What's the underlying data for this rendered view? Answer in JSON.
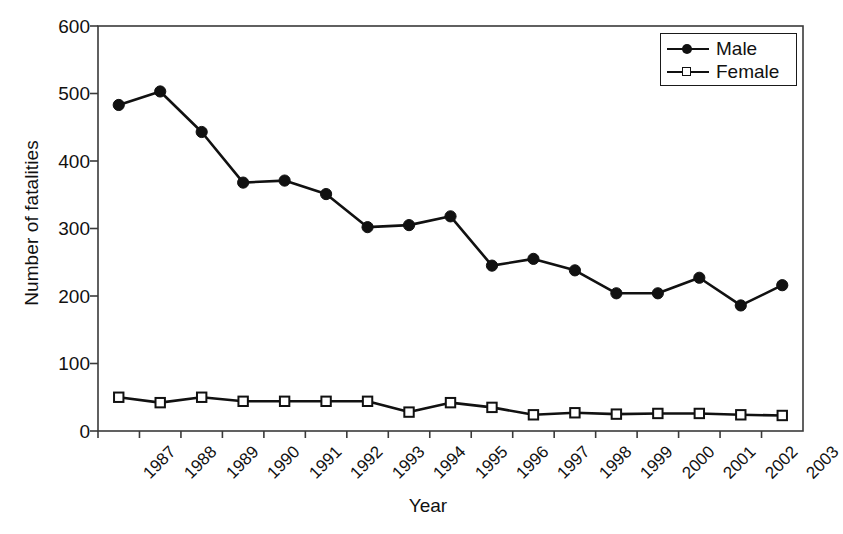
{
  "chart_data": {
    "type": "line",
    "title": "",
    "xlabel": "Year",
    "ylabel": "Number of fatalities",
    "categories": [
      "1987",
      "1988",
      "1989",
      "1990",
      "1991",
      "1992",
      "1993",
      "1994",
      "1995",
      "1996",
      "1997",
      "1998",
      "1999",
      "2000",
      "2001",
      "2002",
      "2003"
    ],
    "series": [
      {
        "name": "Male",
        "marker": "filled-circle",
        "color": "#111111",
        "values": [
          483,
          503,
          443,
          368,
          371,
          351,
          302,
          305,
          318,
          245,
          255,
          238,
          204,
          204,
          227,
          186,
          216
        ]
      },
      {
        "name": "Female",
        "marker": "open-square",
        "color": "#111111",
        "values": [
          50,
          42,
          50,
          44,
          44,
          44,
          44,
          28,
          42,
          35,
          24,
          27,
          25,
          26,
          26,
          24,
          23
        ]
      }
    ],
    "ylim": [
      0,
      600
    ],
    "yticks": [
      0,
      100,
      200,
      300,
      400,
      500,
      600
    ],
    "ytick_labels": [
      "0",
      "100",
      "200",
      "300",
      "400",
      "500",
      "600"
    ],
    "grid": false,
    "legend_position": "top-right"
  },
  "axes": {
    "y_title": "Number of fatalities",
    "x_title": "Year"
  },
  "legend": {
    "entries": [
      {
        "label": "Male"
      },
      {
        "label": "Female"
      }
    ]
  }
}
